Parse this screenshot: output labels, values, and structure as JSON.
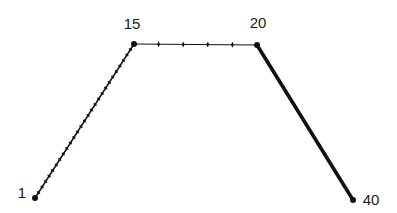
{
  "diagram": {
    "background": "#ffffff",
    "line_color": "#111111",
    "points": [
      {
        "id": "p1",
        "label": "1",
        "x": 35,
        "y": 198,
        "label_x": 22,
        "label_y": 198
      },
      {
        "id": "p15",
        "label": "15",
        "x": 134,
        "y": 44,
        "label_x": 132,
        "label_y": 29
      },
      {
        "id": "p20",
        "label": "20",
        "x": 257,
        "y": 45,
        "label_x": 258,
        "label_y": 28
      },
      {
        "id": "p40",
        "label": "40",
        "x": 353,
        "y": 200,
        "label_x": 371,
        "label_y": 205
      }
    ],
    "segments": [
      {
        "id": "seg-1-15",
        "from": "p1",
        "to": "p15",
        "stroke_width": 1.5,
        "ticks": 27,
        "style": "dense-ticks"
      },
      {
        "id": "seg-15-20",
        "from": "p15",
        "to": "p20",
        "stroke_width": 1.2,
        "ticks": 4,
        "style": "sparse-ticks"
      },
      {
        "id": "seg-20-40",
        "from": "p20",
        "to": "p40",
        "stroke_width": 3.6,
        "ticks": 0,
        "style": "thick"
      }
    ]
  }
}
